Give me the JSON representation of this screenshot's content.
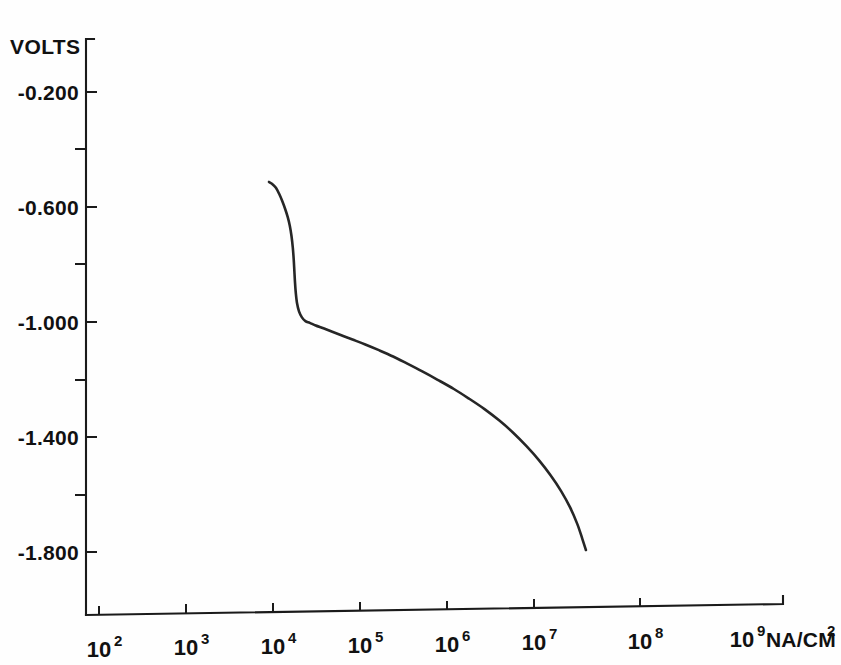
{
  "chart_data": {
    "type": "line",
    "title": "",
    "subtitle": "",
    "xlabel": "NA/CM2",
    "ylabel": "VOLTS",
    "xscale": "log",
    "yscale": "linear",
    "grid": false,
    "legend": false,
    "xlim": [
      100,
      1000000000
    ],
    "ylim": [
      -2.0,
      -0.1
    ],
    "x_tick_labels": [
      "102",
      "103",
      "104",
      "105",
      "106",
      "107",
      "108",
      "109"
    ],
    "x_tick_mantissa": "10",
    "x_tick_exponents": [
      "2",
      "3",
      "4",
      "5",
      "6",
      "7",
      "8",
      "9"
    ],
    "x_tick_values": [
      100,
      1000,
      10000,
      100000,
      1000000,
      10000000,
      100000000,
      1000000000
    ],
    "x_unit_label": "NA/CM",
    "x_unit_exponent": "2",
    "y_tick_labels": [
      "-0.200",
      "-0.600",
      "-1.000",
      "-1.400",
      "-1.800"
    ],
    "y_tick_values": [
      -0.2,
      -0.6,
      -1.0,
      -1.4,
      -1.8
    ],
    "y_minor_tick_values": [
      -0.4,
      -0.8,
      -1.2,
      -1.6
    ],
    "series": [
      {
        "name": "polarization curve",
        "color": "#262626",
        "points": [
          [
            9000,
            -0.513
          ],
          [
            9800,
            -0.52
          ],
          [
            10800,
            -0.533
          ],
          [
            11800,
            -0.555
          ],
          [
            12800,
            -0.58
          ],
          [
            13800,
            -0.607
          ],
          [
            14800,
            -0.636
          ],
          [
            15600,
            -0.665
          ],
          [
            16300,
            -0.7
          ],
          [
            16900,
            -0.742
          ],
          [
            17300,
            -0.782
          ],
          [
            17600,
            -0.822
          ],
          [
            17900,
            -0.862
          ],
          [
            18300,
            -0.9
          ],
          [
            18900,
            -0.935
          ],
          [
            19900,
            -0.963
          ],
          [
            21500,
            -0.984
          ],
          [
            23600,
            -0.997
          ],
          [
            26500,
            -1.003
          ],
          [
            31000,
            -1.012
          ],
          [
            38000,
            -1.022
          ],
          [
            48000,
            -1.034
          ],
          [
            62000,
            -1.047
          ],
          [
            82000,
            -1.061
          ],
          [
            115000,
            -1.078
          ],
          [
            165000,
            -1.098
          ],
          [
            240000,
            -1.12
          ],
          [
            350000,
            -1.145
          ],
          [
            520000,
            -1.172
          ],
          [
            780000,
            -1.201
          ],
          [
            1200000,
            -1.233
          ],
          [
            1800000,
            -1.267
          ],
          [
            2700000,
            -1.303
          ],
          [
            4000000,
            -1.343
          ],
          [
            5800000,
            -1.386
          ],
          [
            8200000,
            -1.432
          ],
          [
            11500000,
            -1.482
          ],
          [
            15500000,
            -1.533
          ],
          [
            20500000,
            -1.588
          ],
          [
            26000000,
            -1.645
          ],
          [
            31500000,
            -1.703
          ],
          [
            36000000,
            -1.755
          ],
          [
            39500000,
            -1.793
          ]
        ]
      }
    ]
  },
  "axes_geometry": {
    "y_axis_x": 86,
    "y_axis_top": 38,
    "y_axis_bottom": 615,
    "x_axis_left": 86,
    "x_axis_right": 783,
    "x_axis_y_left": 615,
    "x_axis_y_right": 604,
    "decade_width": 87,
    "x_first_tick": 99,
    "y_first_tick": 92,
    "y_tick_spacing": 57.5
  }
}
